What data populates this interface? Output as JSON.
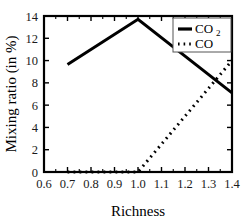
{
  "chart_data": {
    "type": "line",
    "title": "",
    "xlabel": "Richness",
    "ylabel": "Mixing ratio (in %)",
    "xlim": [
      0.6,
      1.4
    ],
    "ylim": [
      0,
      14
    ],
    "xticks": [
      "0.6",
      "0.7",
      "0.8",
      "0.9",
      "1.0",
      "1.1",
      "1.2",
      "1.3",
      "1.4"
    ],
    "xtick_values": [
      0.6,
      0.7,
      0.8,
      0.9,
      1.0,
      1.1,
      1.2,
      1.3,
      1.4
    ],
    "yticks": [
      "0",
      "2",
      "4",
      "6",
      "8",
      "10",
      "12",
      "14"
    ],
    "ytick_values": [
      0,
      2,
      4,
      6,
      8,
      10,
      12,
      14
    ],
    "grid": false,
    "legend_position": "top-right",
    "series": [
      {
        "name": "CO2",
        "legend_label": "CO",
        "legend_subscript": "2",
        "style": "solid",
        "linewidth": 3,
        "color": "#000000",
        "x": [
          0.7,
          1.0,
          1.4
        ],
        "y": [
          9.65,
          13.7,
          7.1
        ]
      },
      {
        "name": "CO",
        "legend_label": "CO",
        "legend_subscript": "",
        "style": "dotted",
        "linewidth": 3,
        "color": "#000000",
        "x": [
          0.7,
          1.0,
          1.4
        ],
        "y": [
          0.0,
          0.0,
          10.0
        ]
      }
    ]
  },
  "legend": {
    "items": [
      {
        "label": "CO",
        "subscript": "2",
        "style": "solid"
      },
      {
        "label": "CO",
        "subscript": "",
        "style": "dotted"
      }
    ]
  }
}
